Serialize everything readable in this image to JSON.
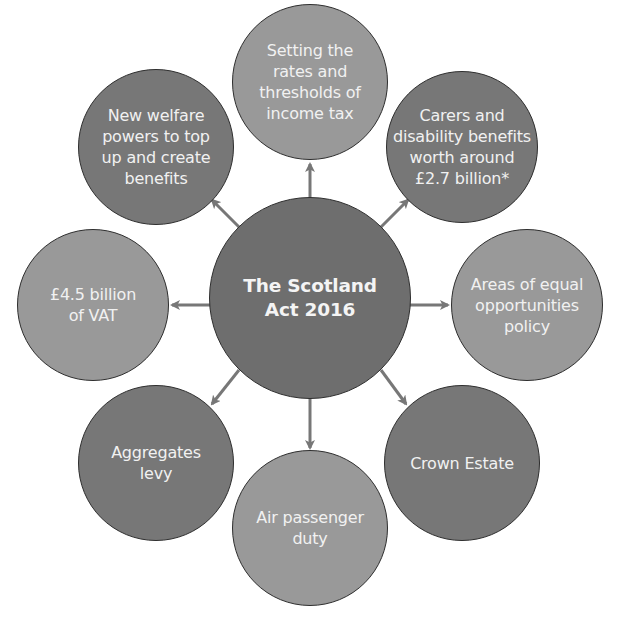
{
  "diagram": {
    "center": {
      "label": "The Scotland\nAct 2016",
      "fill": "#6e6e6e"
    },
    "nodes": [
      {
        "id": "income-tax",
        "label": "Setting the\nrates and\nthresholds of\nincome tax",
        "fill": "#999999"
      },
      {
        "id": "carers-disability",
        "label": "Carers and\ndisability benefits\nworth around\n£2.7 billion*",
        "fill": "#777777"
      },
      {
        "id": "equal-opportunities",
        "label": "Areas of equal\nopportunities\npolicy",
        "fill": "#999999"
      },
      {
        "id": "crown-estate",
        "label": "Crown Estate",
        "fill": "#777777"
      },
      {
        "id": "air-passenger-duty",
        "label": "Air passenger\nduty",
        "fill": "#999999"
      },
      {
        "id": "aggregates-levy",
        "label": "Aggregates\nlevy",
        "fill": "#777777"
      },
      {
        "id": "vat",
        "label": "£4.5 billion\nof VAT",
        "fill": "#999999"
      },
      {
        "id": "welfare-powers",
        "label": "New welfare\npowers to top\nup and create\nbenefits",
        "fill": "#777777"
      }
    ],
    "arrow_color": "#777777",
    "outline_color": "#2e2e2e",
    "text_color": "#f1f1f1"
  }
}
